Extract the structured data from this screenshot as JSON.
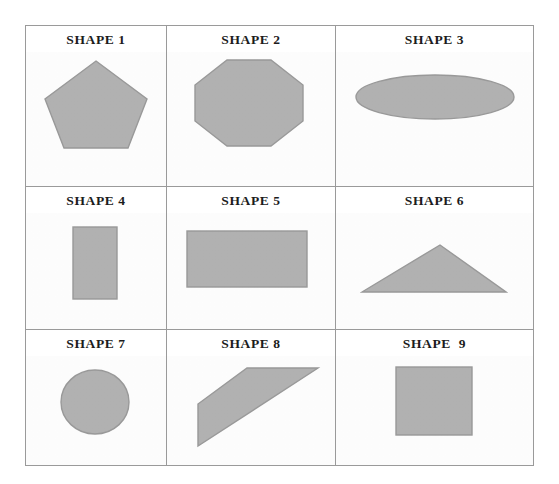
{
  "page": {
    "background_color": "#ffffff",
    "width": 559,
    "height": 484
  },
  "table": {
    "border_color": "#9a9a9a",
    "rows": 3,
    "columns": 3,
    "shape_fill_color": "#b3b3b3",
    "shape_stroke_color": "#9b9b9b",
    "label_color": "#1c1c1c"
  },
  "cells": [
    {
      "label": "SHAPE 1",
      "shape": "pentagon",
      "shape_name": "regular-pentagon"
    },
    {
      "label": "SHAPE 2",
      "shape": "octagon",
      "shape_name": "regular-octagon"
    },
    {
      "label": "SHAPE 3",
      "shape": "ellipse",
      "shape_name": "wide-ellipse"
    },
    {
      "label": "SHAPE 4",
      "shape": "rectangle",
      "shape_name": "tall-rectangle"
    },
    {
      "label": "SHAPE 5",
      "shape": "rectangle",
      "shape_name": "wide-rectangle"
    },
    {
      "label": "SHAPE 6",
      "shape": "triangle",
      "shape_name": "obtuse-triangle"
    },
    {
      "label": "SHAPE 7",
      "shape": "circle",
      "shape_name": "circle"
    },
    {
      "label": "SHAPE 8",
      "shape": "quadrilateral",
      "shape_name": "slanted-quadrilateral"
    },
    {
      "label": "SHAPE  9",
      "shape": "square",
      "shape_name": "square"
    }
  ]
}
